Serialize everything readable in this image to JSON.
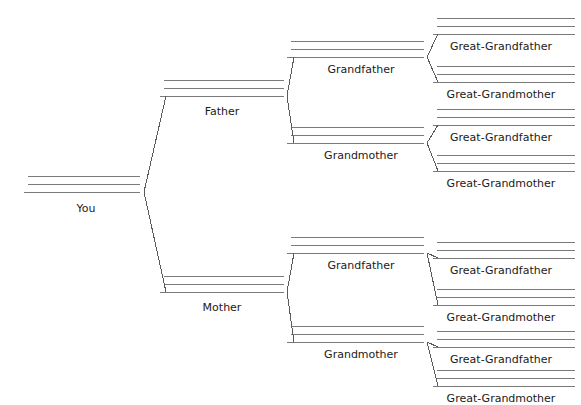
{
  "document": {
    "title": "Ancestor Pedigree Chart",
    "type": "family-tree-fill-in-blank-worksheet",
    "background_color": "#ffffff",
    "line_color": "#7a7a7a",
    "connector_color": "#5a5a5a",
    "text_color": "#1a1a1a",
    "width": 581,
    "height": 399
  },
  "generations": [
    {
      "level": 0,
      "name": "self",
      "nodes": [
        {
          "id": "you",
          "label": "You",
          "label_x": 86,
          "label_y": 202,
          "rule_x1": 28,
          "rule_x2": 140,
          "rule_ys": [
            176,
            184,
            192
          ],
          "blank_lines": 3
        }
      ]
    },
    {
      "level": 1,
      "name": "parents",
      "nodes": [
        {
          "id": "father",
          "label": "Father",
          "label_x": 222,
          "label_y": 105,
          "rule_x1": 164,
          "rule_x2": 284,
          "rule_ys": [
            80,
            88,
            96
          ],
          "blank_lines": 3
        },
        {
          "id": "mother",
          "label": "Mother",
          "label_x": 222,
          "label_y": 301,
          "rule_x1": 164,
          "rule_x2": 284,
          "rule_ys": [
            276,
            284,
            292
          ],
          "blank_lines": 3
        }
      ]
    },
    {
      "level": 2,
      "name": "grandparents",
      "nodes": [
        {
          "id": "paternal-grandfather",
          "label": "Grandfather",
          "label_x": 361,
          "label_y": 63,
          "rule_x1": 291,
          "rule_x2": 424,
          "rule_ys": [
            41,
            49,
            57
          ],
          "blank_lines": 3
        },
        {
          "id": "paternal-grandmother",
          "label": "Grandmother",
          "label_x": 361,
          "label_y": 149,
          "rule_x1": 291,
          "rule_x2": 424,
          "rule_ys": [
            127,
            135,
            143
          ],
          "blank_lines": 3
        },
        {
          "id": "maternal-grandfather",
          "label": "Grandfather",
          "label_x": 361,
          "label_y": 259,
          "rule_x1": 291,
          "rule_x2": 424,
          "rule_ys": [
            237,
            245,
            253
          ],
          "blank_lines": 3
        },
        {
          "id": "maternal-grandmother",
          "label": "Grandmother",
          "label_x": 361,
          "label_y": 348,
          "rule_x1": 291,
          "rule_x2": 424,
          "rule_ys": [
            326,
            334,
            342
          ],
          "blank_lines": 3
        }
      ]
    },
    {
      "level": 3,
      "name": "great-grandparents",
      "nodes": [
        {
          "id": "ggf-1",
          "label": "Great-Grandfather",
          "label_x": 501,
          "label_y": 40,
          "rule_x1": 437,
          "rule_x2": 575,
          "rule_ys": [
            18,
            26,
            34
          ],
          "blank_lines": 3
        },
        {
          "id": "ggm-1",
          "label": "Great-Grandmother",
          "label_x": 501,
          "label_y": 88,
          "rule_x1": 437,
          "rule_x2": 575,
          "rule_ys": [
            66,
            74,
            82
          ],
          "blank_lines": 3
        },
        {
          "id": "ggf-2",
          "label": "Great-Grandfather",
          "label_x": 501,
          "label_y": 131,
          "rule_x1": 437,
          "rule_x2": 575,
          "rule_ys": [
            109,
            117,
            125
          ],
          "blank_lines": 3
        },
        {
          "id": "ggm-2",
          "label": "Great-Grandmother",
          "label_x": 501,
          "label_y": 177,
          "rule_x1": 437,
          "rule_x2": 575,
          "rule_ys": [
            155,
            163,
            171
          ],
          "blank_lines": 3
        },
        {
          "id": "ggf-3",
          "label": "Great-Grandfather",
          "label_x": 501,
          "label_y": 264,
          "rule_x1": 437,
          "rule_x2": 575,
          "rule_ys": [
            242,
            250,
            258
          ],
          "blank_lines": 3
        },
        {
          "id": "ggm-3",
          "label": "Great-Grandmother",
          "label_x": 501,
          "label_y": 311,
          "rule_x1": 437,
          "rule_x2": 575,
          "rule_ys": [
            289,
            297,
            305
          ],
          "blank_lines": 3
        },
        {
          "id": "ggf-4",
          "label": "Great-Grandfather",
          "label_x": 501,
          "label_y": 353,
          "rule_x1": 437,
          "rule_x2": 575,
          "rule_ys": [
            331,
            339,
            347
          ],
          "blank_lines": 3
        },
        {
          "id": "ggm-4",
          "label": "Great-Grandmother",
          "label_x": 501,
          "label_y": 392,
          "rule_x1": 437,
          "rule_x2": 575,
          "rule_ys": [
            370,
            378,
            386
          ],
          "blank_lines": 3
        }
      ]
    }
  ],
  "connectors": [
    {
      "id": "you-to-parents",
      "from": "you",
      "vertex_x": 144,
      "vertex_y": 192,
      "branch_x": 166,
      "top_y": 96,
      "bottom_y": 292
    },
    {
      "id": "father-to-grandparents",
      "from": "father",
      "vertex_x": 287,
      "vertex_y": 96,
      "branch_x": 294,
      "top_y": 57,
      "bottom_y": 143
    },
    {
      "id": "mother-to-grandparents",
      "from": "mother",
      "vertex_x": 287,
      "vertex_y": 292,
      "branch_x": 294,
      "top_y": 253,
      "bottom_y": 342
    },
    {
      "id": "pgf-to-greatgrandparents",
      "from": "paternal-grandfather",
      "vertex_x": 427,
      "vertex_y": 57,
      "branch_x": 438,
      "top_y": 34,
      "bottom_y": 82
    },
    {
      "id": "pgm-to-greatgrandparents",
      "from": "paternal-grandmother",
      "vertex_x": 427,
      "vertex_y": 143,
      "branch_x": 438,
      "top_y": 125,
      "bottom_y": 171
    },
    {
      "id": "mgf-to-greatgrandparents",
      "from": "maternal-grandfather",
      "vertex_x": 427,
      "vertex_y": 253,
      "branch_x": 438,
      "top_y": 258,
      "bottom_y": 305
    },
    {
      "id": "mgm-to-greatgrandparents",
      "from": "maternal-grandmother",
      "vertex_x": 427,
      "vertex_y": 342,
      "branch_x": 438,
      "top_y": 347,
      "bottom_y": 386
    }
  ]
}
